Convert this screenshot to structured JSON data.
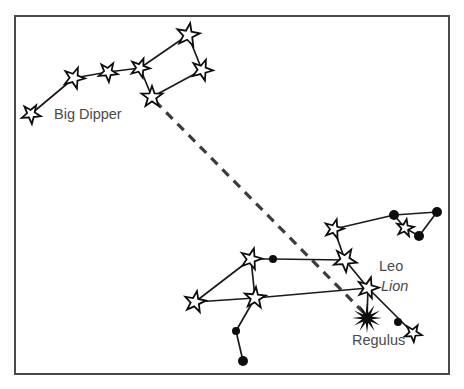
{
  "figure": {
    "background_color": "#ffffff",
    "frame_color": "#4a4a4a",
    "line_color": "#1a1a1a",
    "label_color": "#4a4a4a",
    "pointer_color": "#3c3c3c"
  },
  "frame": {
    "x": 15,
    "y": 16,
    "width": 434,
    "height": 358
  },
  "labels": [
    {
      "id": "big-dipper",
      "text": "Big Dipper",
      "x": 54,
      "y": 119,
      "style": "normal",
      "anchor": "start"
    },
    {
      "id": "leo",
      "text": "Leo",
      "x": 379,
      "y": 271,
      "style": "normal",
      "anchor": "start"
    },
    {
      "id": "lion",
      "text": "Lion",
      "x": 381,
      "y": 291,
      "style": "italic",
      "anchor": "start"
    },
    {
      "id": "regulus",
      "text": "Regulus",
      "x": 352,
      "y": 345,
      "style": "normal",
      "anchor": "start"
    }
  ],
  "chart_data": {
    "type": "diagram",
    "subtype": "star-chart",
    "constellations": [
      {
        "name": "Big Dipper",
        "label": "Big Dipper",
        "stars": [
          {
            "id": "alkaid",
            "x": 31,
            "y": 114,
            "glyph": "star",
            "size": 10
          },
          {
            "id": "mizar",
            "x": 74,
            "y": 78,
            "glyph": "star",
            "size": 11
          },
          {
            "id": "alioth",
            "x": 108,
            "y": 72,
            "glyph": "star",
            "size": 10
          },
          {
            "id": "megrez",
            "x": 140,
            "y": 68,
            "glyph": "star",
            "size": 10
          },
          {
            "id": "phecda",
            "x": 152,
            "y": 97,
            "glyph": "star",
            "size": 11
          },
          {
            "id": "merak",
            "x": 202,
            "y": 70,
            "glyph": "star",
            "size": 11
          },
          {
            "id": "dubhe",
            "x": 188,
            "y": 35,
            "glyph": "star",
            "size": 12
          }
        ],
        "segments": [
          [
            "alkaid",
            "mizar"
          ],
          [
            "mizar",
            "alioth"
          ],
          [
            "alioth",
            "megrez"
          ],
          [
            "megrez",
            "phecda"
          ],
          [
            "megrez",
            "dubhe"
          ],
          [
            "dubhe",
            "merak"
          ],
          [
            "merak",
            "phecda"
          ]
        ]
      },
      {
        "name": "Leo",
        "label": "Leo",
        "sub_label": "Lion",
        "stars": [
          {
            "id": "denebola",
            "x": 195,
            "y": 302,
            "glyph": "star",
            "size": 11
          },
          {
            "id": "zosma",
            "x": 251,
            "y": 259,
            "glyph": "star",
            "size": 11
          },
          {
            "id": "chort",
            "x": 255,
            "y": 298,
            "glyph": "star",
            "size": 11
          },
          {
            "id": "iota-leo",
            "x": 236,
            "y": 331,
            "glyph": "dot",
            "size": 4
          },
          {
            "id": "sigma-leo",
            "x": 243,
            "y": 361,
            "glyph": "dot",
            "size": 5
          },
          {
            "id": "tau-leo",
            "x": 273,
            "y": 259,
            "glyph": "dot",
            "size": 4
          },
          {
            "id": "algieba",
            "x": 345,
            "y": 260,
            "glyph": "star",
            "size": 12
          },
          {
            "id": "zeta-leo",
            "x": 334,
            "y": 229,
            "glyph": "star",
            "size": 10
          },
          {
            "id": "eta-leo",
            "x": 368,
            "y": 288,
            "glyph": "star",
            "size": 11
          },
          {
            "id": "regulus",
            "x": 367,
            "y": 318,
            "glyph": "starburst",
            "size": 15
          },
          {
            "id": "rho-leo",
            "x": 398,
            "y": 322,
            "glyph": "dot",
            "size": 4
          },
          {
            "id": "omicron-leo",
            "x": 413,
            "y": 333,
            "glyph": "star",
            "size": 9
          },
          {
            "id": "mu-leo",
            "x": 394,
            "y": 215,
            "glyph": "dot",
            "size": 5
          },
          {
            "id": "epsilon-leo",
            "x": 437,
            "y": 212,
            "glyph": "dot",
            "size": 5
          },
          {
            "id": "lambda-leo",
            "x": 419,
            "y": 236,
            "glyph": "dot",
            "size": 5
          },
          {
            "id": "kappa-leo",
            "x": 405,
            "y": 228,
            "glyph": "star",
            "size": 9
          }
        ],
        "segments": [
          [
            "denebola",
            "zosma"
          ],
          [
            "denebola",
            "chort"
          ],
          [
            "zosma",
            "chort"
          ],
          [
            "zosma",
            "tau-leo"
          ],
          [
            "tau-leo",
            "algieba"
          ],
          [
            "chort",
            "iota-leo"
          ],
          [
            "iota-leo",
            "sigma-leo"
          ],
          [
            "chort",
            "eta-leo"
          ],
          [
            "algieba",
            "zeta-leo"
          ],
          [
            "algieba",
            "eta-leo"
          ],
          [
            "eta-leo",
            "regulus"
          ],
          [
            "eta-leo",
            "omicron-leo"
          ],
          [
            "zeta-leo",
            "mu-leo"
          ],
          [
            "mu-leo",
            "epsilon-leo"
          ],
          [
            "mu-leo",
            "kappa-leo"
          ],
          [
            "kappa-leo",
            "lambda-leo"
          ],
          [
            "lambda-leo",
            "epsilon-leo"
          ]
        ]
      }
    ],
    "pointer": {
      "id": "pointer-line",
      "label": "Pointer from Big Dipper bowl to Regulus",
      "from": {
        "x": 155,
        "y": 101
      },
      "to": {
        "x": 368,
        "y": 317
      },
      "style": "dashed"
    }
  }
}
